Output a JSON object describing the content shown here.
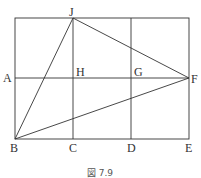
{
  "figure": {
    "caption": "図 7.9",
    "stroke_color": "#333333",
    "points": {
      "A": {
        "label": "A"
      },
      "B": {
        "label": "B"
      },
      "C": {
        "label": "C"
      },
      "D": {
        "label": "D"
      },
      "E": {
        "label": "E"
      },
      "F": {
        "label": "F"
      },
      "G": {
        "label": "G"
      },
      "H": {
        "label": "H"
      },
      "J": {
        "label": "J"
      }
    },
    "segments": [
      "outer rectangle",
      "vertical J-C",
      "vertical through G-D",
      "horizontal A-F",
      "B-J",
      "J-F",
      "B-F"
    ]
  }
}
